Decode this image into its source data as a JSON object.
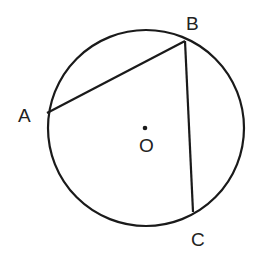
{
  "diagram": {
    "circle": {
      "cx": 146,
      "cy": 128,
      "r": 98,
      "stroke": "#1a1a1a"
    },
    "center": {
      "label": "O",
      "x": 145,
      "y": 128
    },
    "points": [
      {
        "label": "A",
        "x": 47,
        "y": 113,
        "lx": 18,
        "ly": 122
      },
      {
        "label": "B",
        "x": 185,
        "y": 41,
        "lx": 186,
        "ly": 30
      },
      {
        "label": "C",
        "x": 193,
        "y": 212,
        "lx": 191,
        "ly": 246
      }
    ],
    "segments": [
      {
        "from": "A",
        "to": "B"
      },
      {
        "from": "B",
        "to": "C"
      }
    ]
  }
}
